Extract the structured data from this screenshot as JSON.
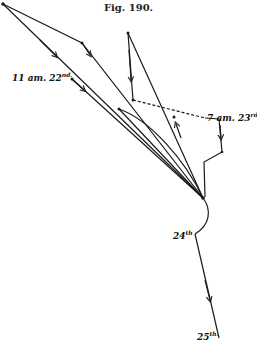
{
  "figure": {
    "title": "Fig. 190.",
    "labels": {
      "l1": {
        "main": "11 am. 22",
        "sup": "nd."
      },
      "l2": {
        "main": "7 am. 23",
        "sup": "rd."
      },
      "l3": {
        "main": "24",
        "sup": "th"
      },
      "l4": {
        "main": "25",
        "sup": "th."
      }
    },
    "colors": {
      "ink": "#1a1a1a",
      "background": "#ffffff"
    }
  }
}
